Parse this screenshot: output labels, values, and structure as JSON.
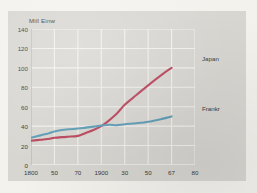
{
  "figure": {
    "background_color": "#d8d6d1",
    "page_color": "#f4f2ed",
    "grid_color": "#f2f0ec",
    "axis_color": "#9a9893",
    "text_color": "#3a3a38"
  },
  "axis_title": "Mill Einw",
  "series_labels": {
    "japan": "Japan",
    "frankr": "Frankr"
  },
  "chart_data": {
    "type": "line",
    "title": "",
    "subtitle": "",
    "xlabel": "",
    "ylabel": "Mill Einw",
    "ylim": [
      0,
      140
    ],
    "ytick_labels": [
      "140",
      "120",
      "100",
      "80",
      "60",
      "40",
      "20",
      "0"
    ],
    "ytick_values": [
      140,
      120,
      100,
      80,
      60,
      40,
      20,
      0
    ],
    "xtick_labels": [
      "1800",
      "50",
      "70",
      "1900",
      "30",
      "50",
      "67",
      "80"
    ],
    "xtick_values": [
      1800,
      1850,
      1870,
      1900,
      1930,
      1950,
      1967,
      1980
    ],
    "grid": true,
    "legend_position": "right-inline",
    "annotations": [
      {
        "text": "Japan",
        "at_x": 1967,
        "at_y": 100
      },
      {
        "text": "Frankr",
        "at_x": 1967,
        "at_y": 50
      }
    ],
    "series": [
      {
        "name": "Japan",
        "color": "#b9425a",
        "x": [
          1800,
          1820,
          1840,
          1850,
          1860,
          1870,
          1880,
          1890,
          1900,
          1910,
          1920,
          1930,
          1940,
          1950,
          1960,
          1967
        ],
        "values": [
          25,
          26,
          27,
          28,
          29,
          30,
          33,
          36,
          40,
          46,
          53,
          62,
          72,
          82,
          93,
          100
        ]
      },
      {
        "name": "Frankr",
        "color": "#5b9bb5",
        "x": [
          1800,
          1820,
          1840,
          1850,
          1860,
          1870,
          1880,
          1890,
          1900,
          1910,
          1920,
          1930,
          1940,
          1950,
          1960,
          1967
        ],
        "values": [
          28,
          30.5,
          33,
          34.5,
          36.5,
          37.5,
          38.5,
          39.5,
          40.5,
          41.5,
          41,
          42,
          43,
          44.5,
          47.5,
          50
        ]
      }
    ]
  }
}
